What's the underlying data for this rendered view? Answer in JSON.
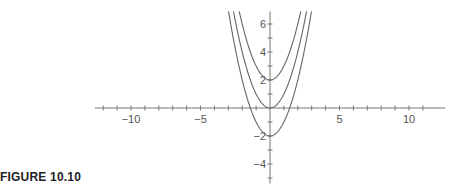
{
  "caption": "FIGURE 10.10",
  "chart_data": {
    "type": "line",
    "title": "",
    "xlabel": "",
    "ylabel": "",
    "xlim": [
      -12.6,
      12.6
    ],
    "ylim": [
      -5.4,
      6.9
    ],
    "grid": false,
    "legend": "none",
    "x_ticks": [
      -12,
      -11,
      -10,
      -9,
      -8,
      -7,
      -6,
      -5,
      -4,
      -3,
      -2,
      -1,
      1,
      2,
      3,
      4,
      5,
      6,
      7,
      8,
      9,
      10,
      11
    ],
    "x_tick_labels": [
      {
        "value": -10,
        "label": "−10"
      },
      {
        "value": -5,
        "label": "−5"
      },
      {
        "value": 5,
        "label": "5"
      },
      {
        "value": 10,
        "label": "10"
      }
    ],
    "y_ticks": [
      -5,
      -4,
      -3,
      -2,
      -1,
      1,
      2,
      3,
      4,
      5,
      6
    ],
    "y_tick_labels": [
      {
        "value": -4,
        "label": "−4"
      },
      {
        "value": -2,
        "label": "−2"
      },
      {
        "value": 2,
        "label": "2"
      },
      {
        "value": 4,
        "label": "4"
      },
      {
        "value": 6,
        "label": "6"
      }
    ],
    "series": [
      {
        "name": "y = x^2 + 2",
        "a": 1,
        "c": 2
      },
      {
        "name": "y = x^2",
        "a": 1,
        "c": 0
      },
      {
        "name": "y = x^2 - 2",
        "a": 1,
        "c": -2
      }
    ],
    "colors": {
      "curve": "#666666",
      "axis": "#777777",
      "text": "#555555"
    }
  }
}
